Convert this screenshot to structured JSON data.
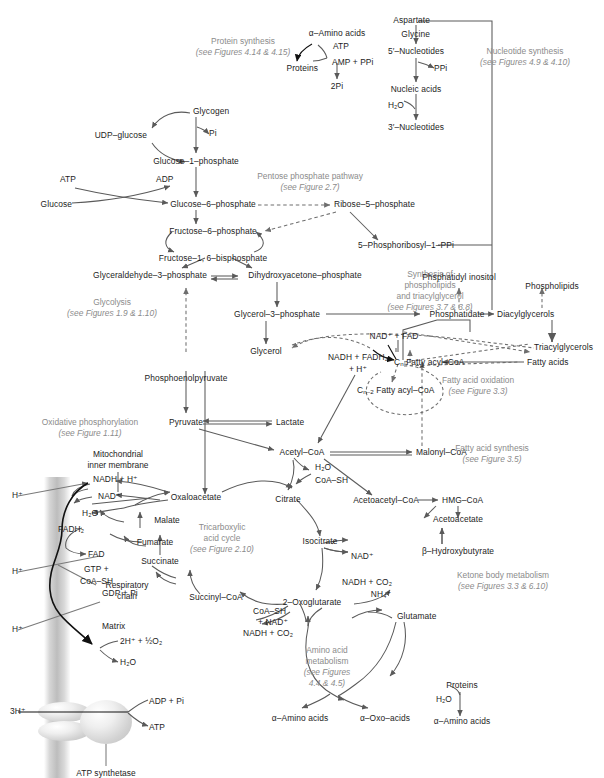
{
  "figure": {
    "type": "metabolic-pathway-diagram"
  },
  "section_notes": [
    {
      "id": "protein-synthesis",
      "line1": "Protein synthesis",
      "line2": "(see Figures 4.14 & 4.15)"
    },
    {
      "id": "nucleotide-synthesis",
      "line1": "Nucleotide synthesis",
      "line2": "(see Figures 4.9 & 4.10)"
    },
    {
      "id": "pentose-phosphate",
      "line1": "Pentose phosphate pathway",
      "line2": "(see Figure 2.7)"
    },
    {
      "id": "glycolysis",
      "line1": "Glycolysis",
      "line2": "(see Figures 1.9 & 1.10)"
    },
    {
      "id": "phospholipid-synthesis",
      "line1": "Synthesis of",
      "line1b": "phospholipids",
      "line1c": "and triacylglycerol",
      "line2": "(see Figures 3.7 & 3.8)"
    },
    {
      "id": "fatty-acid-oxidation",
      "line1": "Fatty acid oxidation",
      "line2": "(see Figure 3.3)"
    },
    {
      "id": "fatty-acid-synthesis",
      "line1": "Fatty acid synthesis",
      "line2": "(see Figure 3.5)"
    },
    {
      "id": "oxidative-phosphorylation",
      "line1": "Oxidative phosphorylation",
      "line2": "(see Figure 1.11)"
    },
    {
      "id": "tricarboxylic-acid-cycle",
      "line1": "Tricarboxylic",
      "line1b": "acid cycle",
      "line2": "(see Figure 2.10)"
    },
    {
      "id": "ketone-body-metabolism",
      "line1": "Ketone body metabolism",
      "line2": "(see Figures 3.3 & 6.10)"
    },
    {
      "id": "amino-acid-metabolism",
      "line1": "Amino acid",
      "line1b": "metabolism",
      "line2": "(see Figures",
      "line3": "4.4 & 4.5)"
    }
  ],
  "metabolites": {
    "alpha_amino_acids": "α–Amino acids",
    "atp": "ATP",
    "amp_ppi": "AMP + PPi",
    "proteins": "Proteins",
    "two_pi": "2Pi",
    "aspartate": "Aspartate",
    "glycine": "Glycine",
    "five_nucleotides": "5′–Nucleotides",
    "ppi": "PPi",
    "nucleic_acids": "Nucleic acids",
    "h2o": "H₂O",
    "three_nucleotides": "3′–Nucleotides",
    "glycogen": "Glycogen",
    "udp_glucose": "UDP–glucose",
    "pi": "Pi",
    "glucose_1_phosphate": "Glucose–1–phosphate",
    "adp": "ADP",
    "glucose": "Glucose",
    "glucose_6_phosphate": "Glucose–6–phosphate",
    "ribose_5_phosphate": "Ribose–5–phosphate",
    "fructose_6_phosphate": "Fructose–6–phosphate",
    "fructose_1_6_bisphosphate": "Fructose–1, 6–bisphosphate",
    "phosphoribosyl_ppi": "5–Phosphoribosyl–1–PPi",
    "glyceraldehyde_3_phosphate": "Glyceraldehyde–3–phosphate",
    "dihydroxyacetone_phosphate": "Dihydroxyacetone–phosphate",
    "glycerol_3_phosphate": "Glycerol–3–phosphate",
    "glycerol": "Glycerol",
    "phosphoenolpyruvate": "Phosphoenolpyruvate",
    "phosphatidyl_inositol": "Phsphatidyl inositol",
    "phospholipids": "Phospholipids",
    "phosphatidate": "Phosphatidate",
    "diacylglycerols": "Diacylglycerols",
    "triacylglycerols": "Triacylglycerols",
    "fatty_acids": "Fatty acids",
    "nad_fad": "NAD⁺ + FAD",
    "nadh_fadh2": "NADH + FADH₂",
    "plus_h": "+ H⁺",
    "cn_fatty_acyl_coa": "Fatty acyl–CoA",
    "cn_prefix": "C",
    "cn_sub": "n",
    "cn2_sub": "n–2",
    "pyruvate": "Pyruvate",
    "lactate": "Lactate",
    "acetyl_coa": "Acetyl–CoA",
    "malonyl_coa": "Malonyl–CoA",
    "coa_sh": "CoA–SH",
    "citrate": "Citrate",
    "oxaloacetate": "Oxaloacetate",
    "malate": "Malate",
    "fumarate": "Fumarate",
    "succinate": "Succinate",
    "succinyl_coa": "Succinyl–CoA",
    "isocitrate": "Isocitrate",
    "nad_plus": "NAD⁺",
    "nadh_co2": "NADH + CO₂",
    "two_oxoglutarate": "2–Oxoglutarate",
    "coa_sh_plus_nad": "+ NAD⁺",
    "nh4": "NH₄⁺",
    "glutamate": "Glutamate",
    "alpha_oxo_acids": "α–Oxo–acids",
    "acetoacetyl_coa": "Acetoacetyl–CoA",
    "hmg_coa": "HMG–CoA",
    "acetoacetate": "Acetoacetate",
    "beta_hydroxybutyrate": "β–Hydroxybutyrate",
    "nadh_h": "NADH + H⁺",
    "fadh2": "FADH₂",
    "fad": "FAD",
    "gtp_plus": "GTP +",
    "gdp_pi": "GDP + Pi",
    "h_plus": "H⁺",
    "three_h_plus": "3H⁺",
    "two_h_half_o2": "2H⁺ + ½O₂",
    "adp_pi": "ADP + Pi"
  },
  "structures": {
    "mitochondrial_inner_membrane_l1": "Mitochondrial",
    "mitochondrial_inner_membrane_l2": "inner membrane",
    "respiratory_chain_l1": "Respiratory",
    "respiratory_chain_l2": "chain",
    "matrix": "Matrix",
    "atp_synthetase": "ATP synthetase"
  },
  "colors": {
    "stroke": "#5a5a5a",
    "dashed": "#6e6e6e",
    "text": "#1c1c1c",
    "note": "#8b8b8b",
    "membrane": "#c4c4c4"
  }
}
